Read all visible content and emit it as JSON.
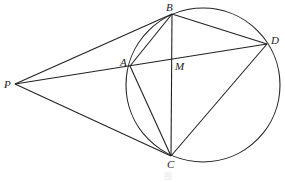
{
  "diagram": {
    "type": "geometry",
    "circle": {
      "cx": 203,
      "cy": 85,
      "r": 77
    },
    "points": {
      "P": {
        "label": "P",
        "x": 15,
        "y": 84,
        "lx": 4,
        "ly": 88
      },
      "A": {
        "label": "A",
        "x": 130,
        "y": 66,
        "lx": 120,
        "ly": 66
      },
      "B": {
        "label": "B",
        "x": 172,
        "y": 14,
        "lx": 166,
        "ly": 11
      },
      "D": {
        "label": "D",
        "x": 267,
        "y": 44,
        "lx": 271,
        "ly": 44
      },
      "M": {
        "label": "M",
        "x": 172,
        "y": 59,
        "lx": 175,
        "ly": 70
      },
      "C": {
        "label": "C",
        "x": 171,
        "y": 156,
        "lx": 167,
        "ly": 168
      }
    },
    "segments": [
      "PB",
      "PC",
      "PD",
      "AB",
      "AC",
      "BC",
      "BD",
      "CD"
    ],
    "caption": "图"
  }
}
